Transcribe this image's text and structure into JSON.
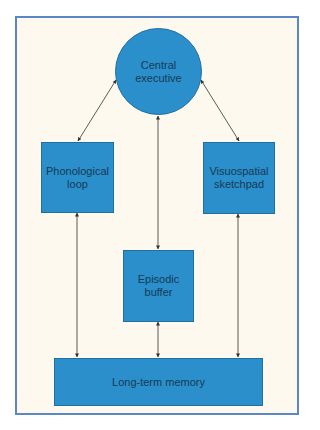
{
  "diagram": {
    "title": "",
    "colors": {
      "node_fill": "#2a8fcb",
      "node_border": "#1f6fa3",
      "frame_border": "#5b87c6",
      "background": "#fdf9ef",
      "text": "#173a56",
      "arrow": "#333333"
    },
    "nodes": [
      {
        "id": "central",
        "shape": "circle",
        "lines": [
          "Central",
          "executive"
        ]
      },
      {
        "id": "phono",
        "shape": "rect",
        "lines": [
          "Phonological",
          "loop"
        ]
      },
      {
        "id": "visuo",
        "shape": "rect",
        "lines": [
          "Visuospatial",
          "sketchpad"
        ]
      },
      {
        "id": "episodic",
        "shape": "rect",
        "lines": [
          "Episodic",
          "buffer"
        ]
      },
      {
        "id": "ltm",
        "shape": "rect",
        "lines": [
          "Long-term memory"
        ]
      }
    ],
    "edges": [
      {
        "from": "central",
        "to": "phono",
        "direction": "both"
      },
      {
        "from": "central",
        "to": "visuo",
        "direction": "both"
      },
      {
        "from": "central",
        "to": "episodic",
        "direction": "both"
      },
      {
        "from": "phono",
        "to": "ltm",
        "direction": "both"
      },
      {
        "from": "visuo",
        "to": "ltm",
        "direction": "both"
      },
      {
        "from": "episodic",
        "to": "ltm",
        "direction": "both"
      }
    ]
  }
}
